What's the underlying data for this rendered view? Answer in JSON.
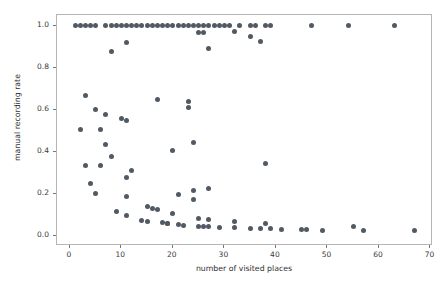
{
  "chart_data": {
    "type": "scatter",
    "title": "",
    "xlabel": "number of visited places",
    "ylabel": "manual recording rate",
    "xlim": [
      -2.5,
      70.5
    ],
    "ylim": [
      -0.05,
      1.05
    ],
    "xticks": [
      0,
      10,
      20,
      30,
      40,
      50,
      60,
      70
    ],
    "yticks": [
      0.0,
      0.2,
      0.4,
      0.6,
      0.8,
      1.0
    ],
    "xticklabels": [
      "0",
      "10",
      "20",
      "30",
      "40",
      "50",
      "60",
      "70"
    ],
    "yticklabels": [
      "0.0",
      "0.2",
      "0.4",
      "0.6",
      "0.8",
      "1.0"
    ],
    "grid": false,
    "legend": null,
    "marker": "circle",
    "marker_color": "#515a63",
    "marker_size": 5,
    "series": [
      {
        "name": "places vs manual recording rate",
        "points": [
          [
            1,
            1.0
          ],
          [
            2,
            1.0
          ],
          [
            3,
            1.0
          ],
          [
            4,
            1.0
          ],
          [
            5,
            1.0
          ],
          [
            7,
            1.0
          ],
          [
            8,
            1.0
          ],
          [
            9,
            1.0
          ],
          [
            10,
            1.0
          ],
          [
            11,
            1.0
          ],
          [
            12,
            1.0
          ],
          [
            13,
            1.0
          ],
          [
            14,
            1.0
          ],
          [
            15,
            1.0
          ],
          [
            16,
            1.0
          ],
          [
            17,
            1.0
          ],
          [
            18,
            1.0
          ],
          [
            19,
            1.0
          ],
          [
            20,
            1.0
          ],
          [
            21,
            1.0
          ],
          [
            22,
            1.0
          ],
          [
            23,
            1.0
          ],
          [
            24,
            1.0
          ],
          [
            25,
            1.0
          ],
          [
            26,
            1.0
          ],
          [
            27,
            1.0
          ],
          [
            28,
            1.0
          ],
          [
            29,
            1.0
          ],
          [
            30,
            1.0
          ],
          [
            31,
            1.0
          ],
          [
            33,
            1.0
          ],
          [
            35,
            1.0
          ],
          [
            36,
            1.0
          ],
          [
            38,
            1.0
          ],
          [
            39,
            1.0
          ],
          [
            47,
            1.0
          ],
          [
            54,
            1.0
          ],
          [
            63,
            1.0
          ],
          [
            25,
            0.965
          ],
          [
            26,
            0.965
          ],
          [
            32,
            0.972
          ],
          [
            35,
            0.948
          ],
          [
            37,
            0.924
          ],
          [
            11,
            0.918
          ],
          [
            8,
            0.875
          ],
          [
            27,
            0.89
          ],
          [
            3,
            0.666
          ],
          [
            17,
            0.65
          ],
          [
            23,
            0.64
          ],
          [
            23,
            0.61
          ],
          [
            5,
            0.6
          ],
          [
            7,
            0.575
          ],
          [
            10,
            0.558
          ],
          [
            11,
            0.548
          ],
          [
            2,
            0.503
          ],
          [
            6,
            0.503
          ],
          [
            24,
            0.444
          ],
          [
            7,
            0.432
          ],
          [
            20,
            0.403
          ],
          [
            8,
            0.375
          ],
          [
            38,
            0.345
          ],
          [
            3,
            0.335
          ],
          [
            6,
            0.335
          ],
          [
            12,
            0.31
          ],
          [
            11,
            0.277
          ],
          [
            4,
            0.25
          ],
          [
            27,
            0.225
          ],
          [
            24,
            0.213
          ],
          [
            5,
            0.201
          ],
          [
            21,
            0.193
          ],
          [
            11,
            0.185
          ],
          [
            24,
            0.17
          ],
          [
            15,
            0.137
          ],
          [
            16,
            0.127
          ],
          [
            17,
            0.125
          ],
          [
            9,
            0.113
          ],
          [
            20,
            0.103
          ],
          [
            11,
            0.093
          ],
          [
            25,
            0.083
          ],
          [
            27,
            0.078
          ],
          [
            32,
            0.067
          ],
          [
            14,
            0.073
          ],
          [
            15,
            0.068
          ],
          [
            18,
            0.06
          ],
          [
            19,
            0.058
          ],
          [
            19,
            0.057
          ],
          [
            21,
            0.053
          ],
          [
            25,
            0.044
          ],
          [
            26,
            0.044
          ],
          [
            22,
            0.046
          ],
          [
            27,
            0.044
          ],
          [
            29,
            0.04
          ],
          [
            32,
            0.038
          ],
          [
            35,
            0.034
          ],
          [
            37,
            0.033
          ],
          [
            38,
            0.055
          ],
          [
            39,
            0.033
          ],
          [
            41,
            0.03
          ],
          [
            45,
            0.028
          ],
          [
            46,
            0.028
          ],
          [
            49,
            0.026
          ],
          [
            55,
            0.043
          ],
          [
            57,
            0.025
          ],
          [
            67,
            0.022
          ]
        ]
      }
    ]
  }
}
